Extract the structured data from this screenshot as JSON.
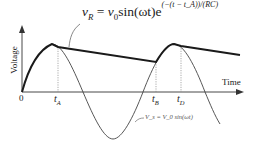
{
  "diagram": {
    "equation": {
      "lhs": "v",
      "lhs_sub": "R",
      "equals": "=",
      "rhs_v": "v",
      "rhs_v_sub": "0",
      "rhs_sin": "sin(ωt)e",
      "exponent": "(−(t − t_A))/(RC)"
    },
    "axes": {
      "y_label": "Voltage",
      "x_label": "Time",
      "origin_label": "0"
    },
    "ticks": [
      {
        "label": "t",
        "sub": "A"
      },
      {
        "label": "t",
        "sub": "B"
      },
      {
        "label": "t",
        "sub": "D"
      }
    ],
    "sine_annotation": "V_s = V_0 sin(ωt)",
    "colors": {
      "envelope": "#1a1a1a",
      "sine": "#444444",
      "axis": "#333333",
      "guides": "#888888"
    }
  }
}
